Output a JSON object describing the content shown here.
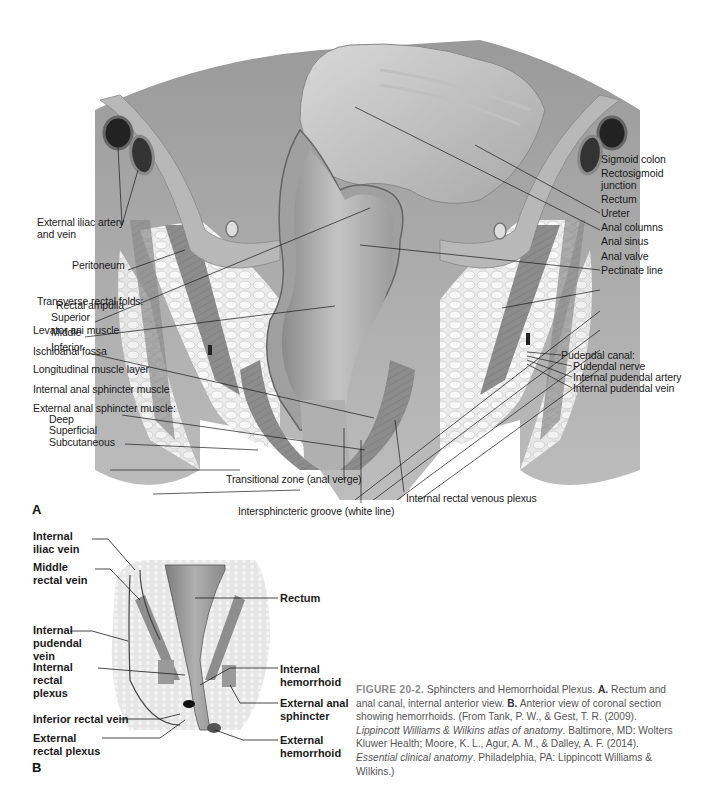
{
  "figure": {
    "panel_a": {
      "letter": "A",
      "labels_left": [
        {
          "id": "ext-iliac-1",
          "text": "External iliac artery"
        },
        {
          "id": "ext-iliac-2",
          "text": "and vein"
        },
        {
          "id": "peritoneum",
          "text": "Peritoneum"
        },
        {
          "id": "transverse-folds",
          "text": "Transverse rectal folds:"
        },
        {
          "id": "superior",
          "text": "Superior"
        },
        {
          "id": "middle",
          "text": "Middle"
        },
        {
          "id": "inferior",
          "text": "Inferior"
        },
        {
          "id": "rectal-ampulla",
          "text": "Rectal ampulla"
        },
        {
          "id": "levator-ani",
          "text": "Levator ani muscle"
        },
        {
          "id": "ischioanal-fossa",
          "text": "Ischioanal fossa"
        },
        {
          "id": "longitudinal-muscle",
          "text": "Longitudinal muscle layer"
        },
        {
          "id": "internal-anal-sphincter",
          "text": "Internal anal sphincter muscle"
        },
        {
          "id": "external-anal-sphincter",
          "text": "External anal sphincter muscle:"
        },
        {
          "id": "deep",
          "text": "Deep"
        },
        {
          "id": "superficial",
          "text": "Superficial"
        },
        {
          "id": "subcutaneous",
          "text": "Subcutaneous"
        }
      ],
      "labels_right": [
        {
          "id": "sigmoid-colon",
          "text": "Sigmoid colon"
        },
        {
          "id": "rectosigmoid-1",
          "text": "Rectosigmoid"
        },
        {
          "id": "rectosigmoid-2",
          "text": "junction"
        },
        {
          "id": "rectum",
          "text": "Rectum"
        },
        {
          "id": "ureter",
          "text": "Ureter"
        },
        {
          "id": "anal-columns",
          "text": "Anal columns"
        },
        {
          "id": "anal-sinus",
          "text": "Anal sinus"
        },
        {
          "id": "anal-valve",
          "text": "Anal valve"
        },
        {
          "id": "pectinate-line",
          "text": "Pectinate line"
        },
        {
          "id": "pudendal-canal",
          "text": "Pudendal canal:"
        },
        {
          "id": "pudendal-nerve",
          "text": "Pudendal nerve"
        },
        {
          "id": "int-pudendal-artery",
          "text": "Internal pudendal artery"
        },
        {
          "id": "int-pudendal-vein",
          "text": "Internal pudendal vein"
        }
      ],
      "labels_bottom": [
        {
          "id": "transitional-zone",
          "text": "Transitional zone (anal verge)"
        },
        {
          "id": "intersphincteric-groove",
          "text": "Intersphincteric groove (white line)"
        },
        {
          "id": "int-rectal-venous-plexus",
          "text": "Internal rectal venous plexus"
        }
      ]
    },
    "panel_b": {
      "letter": "B",
      "labels_left": [
        {
          "id": "int-iliac-vein",
          "text": "Internal iliac vein"
        },
        {
          "id": "middle-rectal-vein",
          "text": "Middle rectal vein"
        },
        {
          "id": "int-pudendal-vein-b",
          "text": "Internal pudendal vein"
        },
        {
          "id": "int-rectal-plexus",
          "text": "Internal rectal plexus"
        },
        {
          "id": "inf-rectal-vein",
          "text": "Inferior rectal vein"
        },
        {
          "id": "ext-rectal-plexus",
          "text": "External rectal plexus"
        }
      ],
      "labels_right": [
        {
          "id": "rectum-b",
          "text": "Rectum",
          "bold": false
        },
        {
          "id": "internal-hemorrhoid",
          "text": "Internal hemorrhoid",
          "bold": true
        },
        {
          "id": "external-anal-sphincter-b",
          "text": "External anal sphincter",
          "bold": false
        },
        {
          "id": "external-hemorrhoid",
          "text": "External hemorrhoid",
          "bold": true
        }
      ]
    },
    "caption": {
      "figure_id": "FIGURE 20-2.",
      "title": "Sphincters and Hemorrhoidal Plexus.",
      "a_marker": "A.",
      "a_text": "Rectum and anal canal, internal anterior view.",
      "b_marker": "B.",
      "b_text": "Anterior view of coronal section showing hemorrhoids. (From Tank, P. W., & Gest, T. R. (2009).",
      "ref1_title": "Lippincott Williams & Wilkins atlas of anatomy",
      "ref1_rest": ". Baltimore, MD: Wolters Kluwer Health; Moore, K. L., Agur, A. M., & Dalley, A. F. (2014).",
      "ref2_title": "Essential clinical anatomy",
      "ref2_rest": ". Philadelphia, PA: Lippincott Williams & Wilkins.)"
    }
  }
}
